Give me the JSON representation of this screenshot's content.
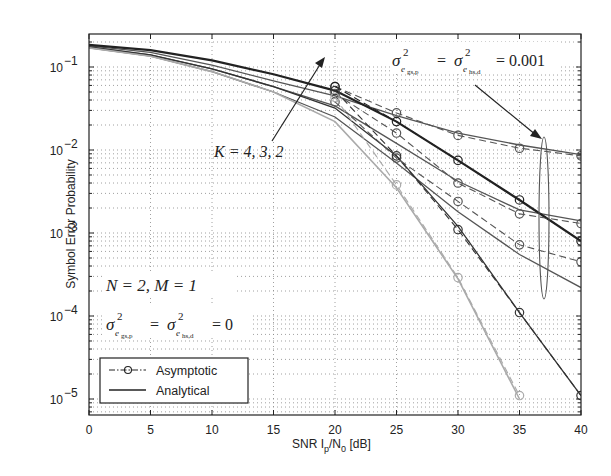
{
  "chart_data": {
    "type": "line",
    "title": "",
    "xlabel": "SNR I_p/N_0 [dB]",
    "ylabel": "Symbol Error Probability",
    "xlim": [
      0,
      40
    ],
    "ylim": [
      6.5e-06,
      0.25
    ],
    "yscale": "log",
    "grid": true,
    "x_ticks": [
      "0",
      "5",
      "10",
      "15",
      "20",
      "25",
      "30",
      "35",
      "40"
    ],
    "y_ticks": [
      "10^-1",
      "10^-2",
      "10^-3",
      "10^-4",
      "10^-5"
    ],
    "legend": {
      "position": "lower left",
      "entries": [
        {
          "label": "Asymptotic",
          "style": "dash-dot with circle markers"
        },
        {
          "label": "Analytical",
          "style": "solid"
        }
      ]
    },
    "annotations": [
      {
        "text": "K = 4, 3, 2",
        "arrow": "from (10 dB, 2e-3) pointing to (19.5 dB, 0.06)"
      },
      {
        "text": "σ²_{e_{gs,p}} = σ²_{e_{hs,d}} = 0.001",
        "arrow": "points to ellipse at 37.5 dB"
      },
      {
        "text": "N = 2, M = 1"
      },
      {
        "text": "σ²_{e_{gs,p}} = σ²_{e_{hs,d}} = 0"
      }
    ],
    "x": [
      0,
      5,
      10,
      15,
      20,
      25,
      30,
      35,
      40
    ],
    "series": [
      {
        "name": "Analytical K=2, σ²=0.001",
        "color": "#555555",
        "width": 1.3,
        "values": [
          0.18,
          0.15,
          0.105,
          0.068,
          0.045,
          0.026,
          0.016,
          0.0115,
          0.0088
        ]
      },
      {
        "name": "Analytical K=3, σ²=0.001",
        "color": "#555555",
        "width": 1.3,
        "values": [
          0.175,
          0.14,
          0.095,
          0.058,
          0.034,
          0.012,
          0.0042,
          0.0019,
          0.0014
        ]
      },
      {
        "name": "Analytical K=4, σ²=0.001",
        "color": "#555555",
        "width": 1.3,
        "values": [
          0.17,
          0.135,
          0.088,
          0.05,
          0.025,
          0.007,
          0.0018,
          0.00055,
          0.00022
        ]
      },
      {
        "name": "Analytical K=2, σ²=0",
        "color": "#222222",
        "width": 2.2,
        "values": [
          0.185,
          0.16,
          0.12,
          0.082,
          0.052,
          0.022,
          0.0075,
          0.0025,
          0.0008
        ]
      },
      {
        "name": "Analytical K=3, σ²=0",
        "color": "#333333",
        "width": 1.3,
        "values": [
          0.175,
          0.14,
          0.095,
          0.058,
          0.032,
          0.0085,
          0.0012,
          0.00011,
          1.1e-05
        ]
      },
      {
        "name": "Analytical K=4, σ²=0",
        "color": "#aaaaaa",
        "width": 1.6,
        "values": [
          0.17,
          0.135,
          0.088,
          0.05,
          0.022,
          0.0035,
          0.00028,
          1e-05,
          null
        ]
      },
      {
        "name": "Asymptotic K=2, σ²=0.001",
        "color": "#555555",
        "dashed": true,
        "markers": true,
        "x": [
          20,
          25,
          30,
          35,
          40
        ],
        "values": [
          0.058,
          0.028,
          0.015,
          0.0105,
          0.0085
        ]
      },
      {
        "name": "Asymptotic K=3, σ²=0.001",
        "color": "#555555",
        "dashed": true,
        "markers": true,
        "x": [
          20,
          25,
          30,
          35,
          40
        ],
        "values": [
          0.048,
          0.016,
          0.004,
          0.0017,
          0.0013
        ]
      },
      {
        "name": "Asymptotic K=4, σ²=0.001",
        "color": "#555555",
        "dashed": true,
        "markers": true,
        "x": [
          20,
          25,
          30,
          35,
          40
        ],
        "values": [
          0.038,
          0.008,
          0.0024,
          0.00072,
          0.00045
        ]
      },
      {
        "name": "Asymptotic K=2, σ²=0",
        "color": "#222222",
        "dashed": true,
        "markers": true,
        "x": [
          20,
          25,
          30,
          35,
          40
        ],
        "values": [
          0.058,
          0.022,
          0.0075,
          0.0025,
          0.0008
        ]
      },
      {
        "name": "Asymptotic K=3, σ²=0",
        "color": "#333333",
        "dashed": true,
        "markers": true,
        "x": [
          20,
          25,
          30,
          35,
          40
        ],
        "values": [
          0.052,
          0.0085,
          0.0011,
          0.00011,
          1.1e-05
        ]
      },
      {
        "name": "Asymptotic K=4, σ²=0",
        "color": "#aaaaaa",
        "dashed": true,
        "markers": true,
        "x": [
          20,
          25,
          30,
          35
        ],
        "values": [
          0.043,
          0.0038,
          0.00029,
          1.1e-05
        ]
      }
    ]
  },
  "labels": {
    "xlabel_main": "SNR I",
    "xlabel_sub1": "p",
    "xlabel_mid": "/N",
    "xlabel_sub2": "0",
    "xlabel_end": " [dB]",
    "ylabel": "Symbol Error Probability",
    "k_annotation": "K = 4, 3, 2",
    "nm_annotation": "N = 2, M = 1",
    "sigma_zero_value": "= 0",
    "sigma_001_value": "= 0.001",
    "legend_asymptotic": "Asymptotic",
    "legend_analytical": "Analytical"
  }
}
